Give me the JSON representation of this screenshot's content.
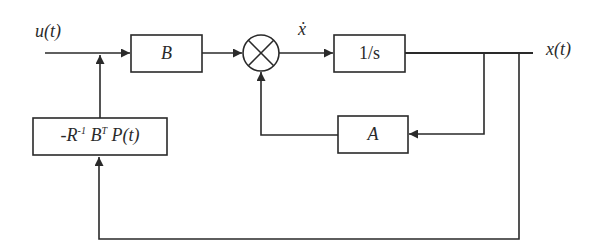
{
  "diagram": {
    "type": "block-diagram",
    "title": "",
    "signals": {
      "input": "u(t)",
      "state_derivative": "ẋ",
      "output": "x(t)"
    },
    "blocks": {
      "input_matrix": "B",
      "integrator": "1/s",
      "state_matrix": "A",
      "feedback_gain": {
        "prefix": "-R",
        "sup1": "-1",
        "mid": " B",
        "sup2": "T",
        "suffix": " P(t)"
      }
    },
    "summing_junction": "⊗",
    "connections": [
      {
        "from": "u(t)",
        "to": "B"
      },
      {
        "from": "B",
        "to": "summing_junction"
      },
      {
        "from": "summing_junction",
        "to": "1/s",
        "label": "ẋ"
      },
      {
        "from": "1/s",
        "to": "x(t)"
      },
      {
        "from": "x(t)",
        "to": "A"
      },
      {
        "from": "A",
        "to": "summing_junction"
      },
      {
        "from": "x(t)",
        "to": "-R^-1 B^T P(t)"
      },
      {
        "from": "-R^-1 B^T P(t)",
        "to": "u(t) line"
      }
    ],
    "colors": {
      "line": "#2a2a2a",
      "background": "#ffffff"
    }
  }
}
